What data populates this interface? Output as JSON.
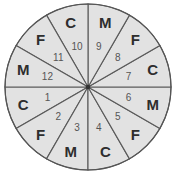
{
  "wheel": {
    "center": [
      88,
      87
    ],
    "radius": 83,
    "letter_radius": 67,
    "number_radius": 42,
    "fill_color": "#e2e2e2",
    "line_color": "#5a5a5a",
    "sectors": [
      {
        "number": "1",
        "letter": "C",
        "start_deg": 180,
        "end_deg": 210
      },
      {
        "number": "2",
        "letter": "F",
        "start_deg": 210,
        "end_deg": 240
      },
      {
        "number": "3",
        "letter": "M",
        "start_deg": 240,
        "end_deg": 270
      },
      {
        "number": "4",
        "letter": "C",
        "start_deg": 270,
        "end_deg": 300
      },
      {
        "number": "5",
        "letter": "F",
        "start_deg": 300,
        "end_deg": 330
      },
      {
        "number": "6",
        "letter": "M",
        "start_deg": 330,
        "end_deg": 360
      },
      {
        "number": "7",
        "letter": "C",
        "start_deg": 0,
        "end_deg": 30
      },
      {
        "number": "8",
        "letter": "F",
        "start_deg": 30,
        "end_deg": 60
      },
      {
        "number": "9",
        "letter": "M",
        "start_deg": 60,
        "end_deg": 90
      },
      {
        "number": "10",
        "letter": "C",
        "start_deg": 90,
        "end_deg": 120
      },
      {
        "number": "11",
        "letter": "F",
        "start_deg": 120,
        "end_deg": 150
      },
      {
        "number": "12",
        "letter": "M",
        "start_deg": 150,
        "end_deg": 180
      }
    ]
  }
}
